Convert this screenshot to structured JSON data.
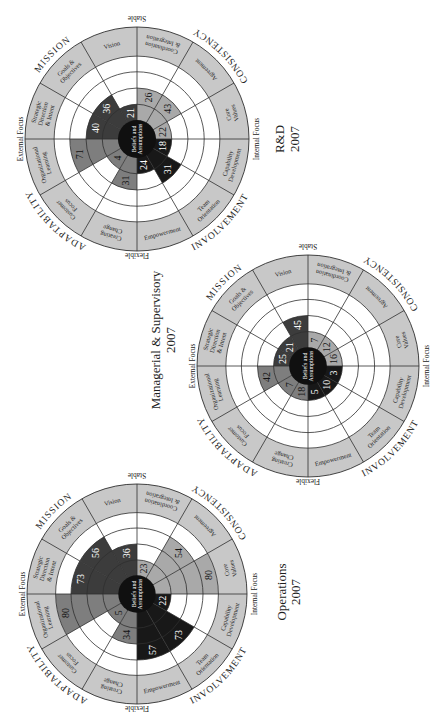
{
  "axis_labels": {
    "top": "Stable",
    "bottom": "Flexible",
    "left": "External Focus",
    "right": "Internal Focus"
  },
  "center_label": [
    "Beliefs and",
    "Assumptions"
  ],
  "traits": [
    {
      "name": "CONSISTENCY",
      "quadrant": "top-right",
      "fill": "#a9a9a9",
      "text_color": "#151515"
    },
    {
      "name": "INVOLVEMENT",
      "quadrant": "bottom-right",
      "fill": "#181818",
      "text_color": "#ffffff"
    },
    {
      "name": "ADAPTABILITY",
      "quadrant": "bottom-left",
      "fill": "#7e7e7e",
      "text_color": "#121212"
    },
    {
      "name": "MISSION",
      "quadrant": "top-left",
      "fill": "#3c3c3c",
      "text_color": "#ffffff"
    }
  ],
  "segments": [
    {
      "key": "coordination-integration",
      "label": "Coordination & Integration",
      "lines": [
        "Coordination",
        "& Integration"
      ],
      "trait": "CONSISTENCY"
    },
    {
      "key": "agreement",
      "label": "Agreement",
      "lines": [
        "Agreement"
      ],
      "trait": "CONSISTENCY"
    },
    {
      "key": "core-values",
      "label": "Core Values",
      "lines": [
        "Core",
        "Values"
      ],
      "trait": "CONSISTENCY"
    },
    {
      "key": "capability-development",
      "label": "Capability Development",
      "lines": [
        "Capability",
        "Development"
      ],
      "trait": "INVOLVEMENT"
    },
    {
      "key": "team-orientation",
      "label": "Team Orientation",
      "lines": [
        "Team",
        "Orientation"
      ],
      "trait": "INVOLVEMENT"
    },
    {
      "key": "empowerment",
      "label": "Empowerment",
      "lines": [
        "Empowerment"
      ],
      "trait": "INVOLVEMENT"
    },
    {
      "key": "creating-change",
      "label": "Creating Change",
      "lines": [
        "Creating",
        "Change"
      ],
      "trait": "ADAPTABILITY"
    },
    {
      "key": "customer-focus",
      "label": "Customer Focus",
      "lines": [
        "Customer",
        "Focus"
      ],
      "trait": "ADAPTABILITY"
    },
    {
      "key": "organizational-learning",
      "label": "Organizational Learning",
      "lines": [
        "Organizational",
        "Learning"
      ],
      "trait": "ADAPTABILITY"
    },
    {
      "key": "strategic-direction-intent",
      "label": "Strategic Direction & Intent",
      "lines": [
        "Strategic",
        "Direction",
        "& Intent"
      ],
      "trait": "MISSION"
    },
    {
      "key": "goals-objectives",
      "label": "Goals & Objectives",
      "lines": [
        "Goals &",
        "Objectives"
      ],
      "trait": "MISSION"
    },
    {
      "key": "vision",
      "label": "Vision",
      "lines": [
        "Vision"
      ],
      "trait": "MISSION"
    }
  ],
  "style": {
    "background": "#ffffff",
    "label_ring": "#c8c8c8",
    "line": "#2f2f2f",
    "core": "#101010"
  },
  "chart_data": [
    {
      "type": "bar",
      "layout": "polar",
      "title": "R&D 2007",
      "title_lines": [
        "R&D",
        "2007"
      ],
      "categories": [
        "Coordination & Integration",
        "Agreement",
        "Core Values",
        "Capability Development",
        "Team Orientation",
        "Empowerment",
        "Creating Change",
        "Customer Focus",
        "Organizational Learning",
        "Strategic Direction & Intent",
        "Goals & Objectives",
        "Vision"
      ],
      "values": [
        26,
        43,
        22,
        18,
        31,
        24,
        31,
        4,
        71,
        40,
        36,
        21
      ],
      "ylim": [
        0,
        100
      ],
      "rings": [
        25,
        50,
        75,
        100
      ],
      "grid": true,
      "legend": "none"
    },
    {
      "type": "bar",
      "layout": "polar",
      "title": "Managerial & Supervisory 2007",
      "title_lines": [
        "Managerial & Supervisory",
        "2007"
      ],
      "categories": [
        "Coordination & Integration",
        "Agreement",
        "Core Values",
        "Capability Development",
        "Team Orientation",
        "Empowerment",
        "Creating Change",
        "Customer Focus",
        "Organizational Learning",
        "Strategic Direction & Intent",
        "Goals & Objectives",
        "Vision"
      ],
      "values": [
        7,
        12,
        16,
        3,
        10,
        5,
        18,
        7,
        42,
        25,
        21,
        45
      ],
      "ylim": [
        0,
        100
      ],
      "rings": [
        25,
        50,
        75,
        100
      ],
      "grid": true,
      "legend": "none"
    },
    {
      "type": "bar",
      "layout": "polar",
      "title": "Operations 2007",
      "title_lines": [
        "Operations",
        "2007"
      ],
      "categories": [
        "Coordination & Integration",
        "Agreement",
        "Core Values",
        "Capability Development",
        "Team Orientation",
        "Empowerment",
        "Creating Change",
        "Customer Focus",
        "Organizational Learning",
        "Strategic Direction & Intent",
        "Goals & Objectives",
        "Vision"
      ],
      "values": [
        23,
        54,
        80,
        22,
        73,
        57,
        34,
        5,
        80,
        73,
        56,
        36
      ],
      "ylim": [
        0,
        100
      ],
      "rings": [
        25,
        50,
        75,
        100
      ],
      "grid": true,
      "legend": "none"
    }
  ]
}
